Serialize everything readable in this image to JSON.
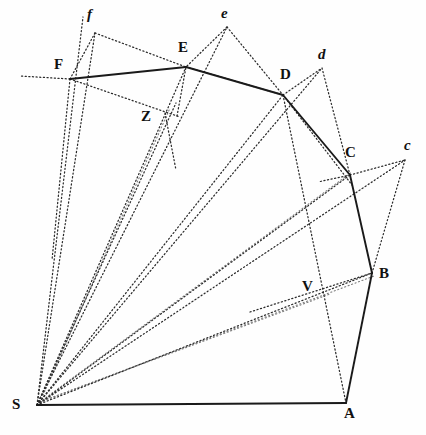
{
  "figure": {
    "width": 426,
    "height": 435,
    "background_color": "#ffffff",
    "solid_stroke_color": "#1a1a1a",
    "dotted_stroke_color": "#2b2b2b",
    "faint_stroke_color": "#7d7d7d"
  },
  "points": [
    {
      "id": "S",
      "label": "S",
      "style": "major",
      "x": 37,
      "y": 405,
      "label_x": 12,
      "label_y": 397
    },
    {
      "id": "A",
      "label": "A",
      "style": "major",
      "x": 346,
      "y": 403,
      "label_x": 344,
      "label_y": 406
    },
    {
      "id": "B",
      "label": "B",
      "style": "major",
      "x": 372,
      "y": 273,
      "label_x": 379,
      "label_y": 266
    },
    {
      "id": "C",
      "label": "C",
      "style": "major",
      "x": 350,
      "y": 175,
      "label_x": 345,
      "label_y": 145
    },
    {
      "id": "D",
      "label": "D",
      "style": "major",
      "x": 283,
      "y": 95,
      "label_x": 280,
      "label_y": 67
    },
    {
      "id": "E",
      "label": "E",
      "style": "major",
      "x": 186,
      "y": 67,
      "label_x": 178,
      "label_y": 40
    },
    {
      "id": "F",
      "label": "F",
      "style": "major",
      "x": 70,
      "y": 79,
      "label_x": 54,
      "label_y": 57
    },
    {
      "id": "Z",
      "label": "Z",
      "style": "major",
      "x": 165,
      "y": 113,
      "label_x": 141,
      "label_y": 109
    },
    {
      "id": "V",
      "label": "V",
      "style": "major",
      "x": 320,
      "y": 297,
      "label_x": 302,
      "label_y": 279
    },
    {
      "id": "c",
      "label": "c",
      "style": "minor",
      "x": 405,
      "y": 160,
      "label_x": 404,
      "label_y": 138
    },
    {
      "id": "d",
      "label": "d",
      "style": "minor",
      "x": 322,
      "y": 68,
      "label_x": 318,
      "label_y": 47
    },
    {
      "id": "e",
      "label": "e",
      "style": "minor",
      "x": 227,
      "y": 27,
      "label_x": 221,
      "label_y": 6
    },
    {
      "id": "f",
      "label": "f",
      "style": "minor",
      "x": 95,
      "y": 33,
      "label_x": 87,
      "label_y": 7
    }
  ],
  "solid_edges": [
    {
      "name": "edge-S-A",
      "from": "S",
      "to": "A"
    },
    {
      "name": "edge-A-B",
      "from": "A",
      "to": "B"
    },
    {
      "name": "edge-B-C",
      "from": "B",
      "to": "C"
    },
    {
      "name": "edge-C-D",
      "from": "C",
      "to": "D"
    },
    {
      "name": "edge-D-E",
      "from": "D",
      "to": "E"
    },
    {
      "name": "edge-E-F",
      "from": "E",
      "to": "F"
    }
  ],
  "dotted_edges": [
    {
      "name": "ray-S-F-extended",
      "x1": 37,
      "y1": 405,
      "x2": 83,
      "y2": 17
    },
    {
      "name": "ray-S-f",
      "x1": 37,
      "y1": 405,
      "x2": 95,
      "y2": 33
    },
    {
      "name": "ray-S-E",
      "x1": 37,
      "y1": 405,
      "x2": 186,
      "y2": 67
    },
    {
      "name": "ray-S-e",
      "x1": 37,
      "y1": 405,
      "x2": 227,
      "y2": 27
    },
    {
      "name": "ray-S-Z",
      "x1": 37,
      "y1": 405,
      "x2": 176,
      "y2": 103
    },
    {
      "name": "ray-S-D",
      "x1": 37,
      "y1": 405,
      "x2": 283,
      "y2": 95
    },
    {
      "name": "ray-S-d",
      "x1": 37,
      "y1": 405,
      "x2": 322,
      "y2": 68
    },
    {
      "name": "ray-S-C",
      "x1": 37,
      "y1": 405,
      "x2": 350,
      "y2": 175
    },
    {
      "name": "ray-S-c",
      "x1": 37,
      "y1": 405,
      "x2": 405,
      "y2": 160
    },
    {
      "name": "ray-S-B",
      "x1": 37,
      "y1": 405,
      "x2": 372,
      "y2": 273
    },
    {
      "name": "chord-F-f",
      "x1": 70,
      "y1": 79,
      "x2": 95,
      "y2": 33
    },
    {
      "name": "chord-f-E",
      "x1": 95,
      "y1": 33,
      "x2": 186,
      "y2": 67
    },
    {
      "name": "chord-F-left-extension",
      "x1": 70,
      "y1": 79,
      "x2": 20,
      "y2": 76
    },
    {
      "name": "chord-F-Z",
      "x1": 70,
      "y1": 79,
      "x2": 180,
      "y2": 117
    },
    {
      "name": "chord-Z-E",
      "x1": 177,
      "y1": 116,
      "x2": 186,
      "y2": 67
    },
    {
      "name": "chord-E-D",
      "x1": 186,
      "y1": 67,
      "x2": 283,
      "y2": 95
    },
    {
      "name": "chord-e-E",
      "x1": 227,
      "y1": 27,
      "x2": 186,
      "y2": 67
    },
    {
      "name": "chord-e-D",
      "x1": 227,
      "y1": 27,
      "x2": 283,
      "y2": 95
    },
    {
      "name": "chord-D-d",
      "x1": 283,
      "y1": 95,
      "x2": 322,
      "y2": 68
    },
    {
      "name": "chord-d-C",
      "x1": 322,
      "y1": 68,
      "x2": 350,
      "y2": 175
    },
    {
      "name": "chord-D-C-dotted",
      "x1": 283,
      "y1": 95,
      "x2": 352,
      "y2": 185
    },
    {
      "name": "chord-C-c",
      "x1": 350,
      "y1": 175,
      "x2": 405,
      "y2": 160
    },
    {
      "name": "chord-c-B",
      "x1": 405,
      "y1": 160,
      "x2": 372,
      "y2": 273
    },
    {
      "name": "chord-C-left-ext",
      "x1": 350,
      "y1": 175,
      "x2": 318,
      "y2": 182
    },
    {
      "name": "chord-D-V",
      "x1": 283,
      "y1": 95,
      "x2": 346,
      "y2": 403
    },
    {
      "name": "chord-V-B",
      "x1": 250,
      "y1": 312,
      "x2": 372,
      "y2": 273
    },
    {
      "name": "chord-Z-F-down",
      "x1": 165,
      "y1": 113,
      "x2": 176,
      "y2": 170
    },
    {
      "name": "chord-F-down-long",
      "x1": 70,
      "y1": 79,
      "x2": 52,
      "y2": 260
    }
  ],
  "faint_edges": [
    {
      "name": "faint-S-C-inner",
      "x1": 40,
      "y1": 402,
      "x2": 352,
      "y2": 172
    },
    {
      "name": "faint-S-B-inner",
      "x1": 40,
      "y1": 402,
      "x2": 374,
      "y2": 276
    },
    {
      "name": "faint-S-V",
      "x1": 40,
      "y1": 402,
      "x2": 330,
      "y2": 294
    },
    {
      "name": "faint-S-Z-inner",
      "x1": 40,
      "y1": 402,
      "x2": 170,
      "y2": 108
    }
  ]
}
